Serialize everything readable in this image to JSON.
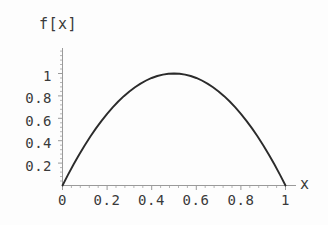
{
  "chart_data": {
    "type": "line",
    "title": "",
    "subtitle": "",
    "xlabel": "x",
    "ylabel": "f[x]",
    "xlim": [
      0,
      1
    ],
    "ylim": [
      0,
      1.05
    ],
    "grid": false,
    "legend": null,
    "xticks": [
      "0",
      "0.2",
      "0.4",
      "0.6",
      "0.8",
      "1"
    ],
    "xtick_values": [
      0,
      0.2,
      0.4,
      0.6,
      0.8,
      1
    ],
    "yticks": [
      "0.2",
      "0.4",
      "0.6",
      "0.8",
      "1"
    ],
    "ytick_values": [
      0.2,
      0.4,
      0.6,
      0.8,
      1
    ],
    "series": [
      {
        "name": "f[x]",
        "color": "#2b2b2b",
        "x": [
          0,
          0.025,
          0.05,
          0.075,
          0.1,
          0.125,
          0.15,
          0.175,
          0.2,
          0.225,
          0.25,
          0.275,
          0.3,
          0.325,
          0.35,
          0.375,
          0.4,
          0.425,
          0.45,
          0.475,
          0.5,
          0.525,
          0.55,
          0.575,
          0.6,
          0.625,
          0.65,
          0.675,
          0.7,
          0.725,
          0.75,
          0.775,
          0.8,
          0.825,
          0.85,
          0.875,
          0.9,
          0.925,
          0.95,
          0.975,
          1
        ],
        "y": [
          0,
          0.0975,
          0.19,
          0.2775,
          0.36,
          0.4375,
          0.51,
          0.5775,
          0.64,
          0.6975,
          0.75,
          0.7975,
          0.84,
          0.8775,
          0.91,
          0.9375,
          0.96,
          0.9775,
          0.99,
          0.9975,
          1,
          0.9975,
          0.99,
          0.9775,
          0.96,
          0.9375,
          0.91,
          0.8775,
          0.84,
          0.7975,
          0.75,
          0.6975,
          0.64,
          0.5775,
          0.51,
          0.4375,
          0.36,
          0.2775,
          0.19,
          0.0975,
          0
        ]
      }
    ],
    "annotations": [],
    "colors": {
      "background": "#fdfdfd",
      "curve": "#2b2b2b",
      "axis": "#9a9a9a",
      "text": "#3a3a3a"
    }
  }
}
